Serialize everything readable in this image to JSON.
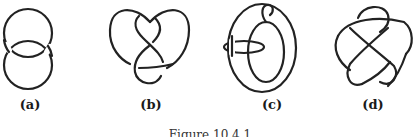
{
  "figure": {
    "caption": "Figure 10.4.1",
    "panels": [
      {
        "id": "a",
        "label": "(a)",
        "description": "Hopf link — two interlocked circles"
      },
      {
        "id": "b",
        "label": "(b)",
        "description": "Knot diagram with heart-shaped outline and figure-eight interior"
      },
      {
        "id": "c",
        "label": "(c)",
        "description": "Torus-like ring with a small loop linked through it"
      },
      {
        "id": "d",
        "label": "(d)",
        "description": "Five-pointed star-like knot diagram"
      }
    ]
  },
  "colors": {
    "stroke": "#222222",
    "background": "#ffffff"
  }
}
